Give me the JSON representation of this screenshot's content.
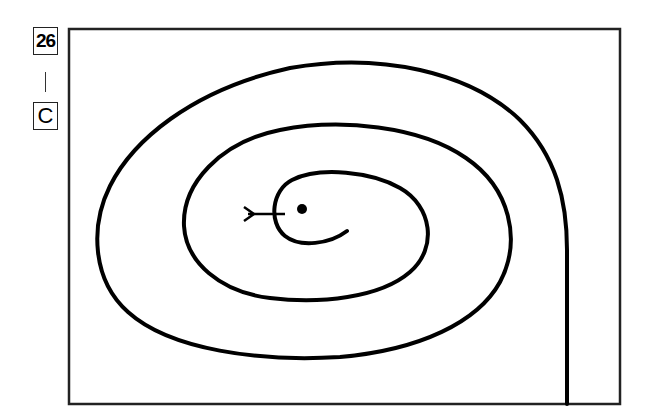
{
  "puzzle": {
    "number": "26",
    "separator": "|",
    "answer_letter": "C",
    "description": "Spiral maze path with start arrow at center and end exiting at bottom right"
  },
  "colors": {
    "line": "#000000",
    "background": "#ffffff",
    "frame": "#222222"
  }
}
